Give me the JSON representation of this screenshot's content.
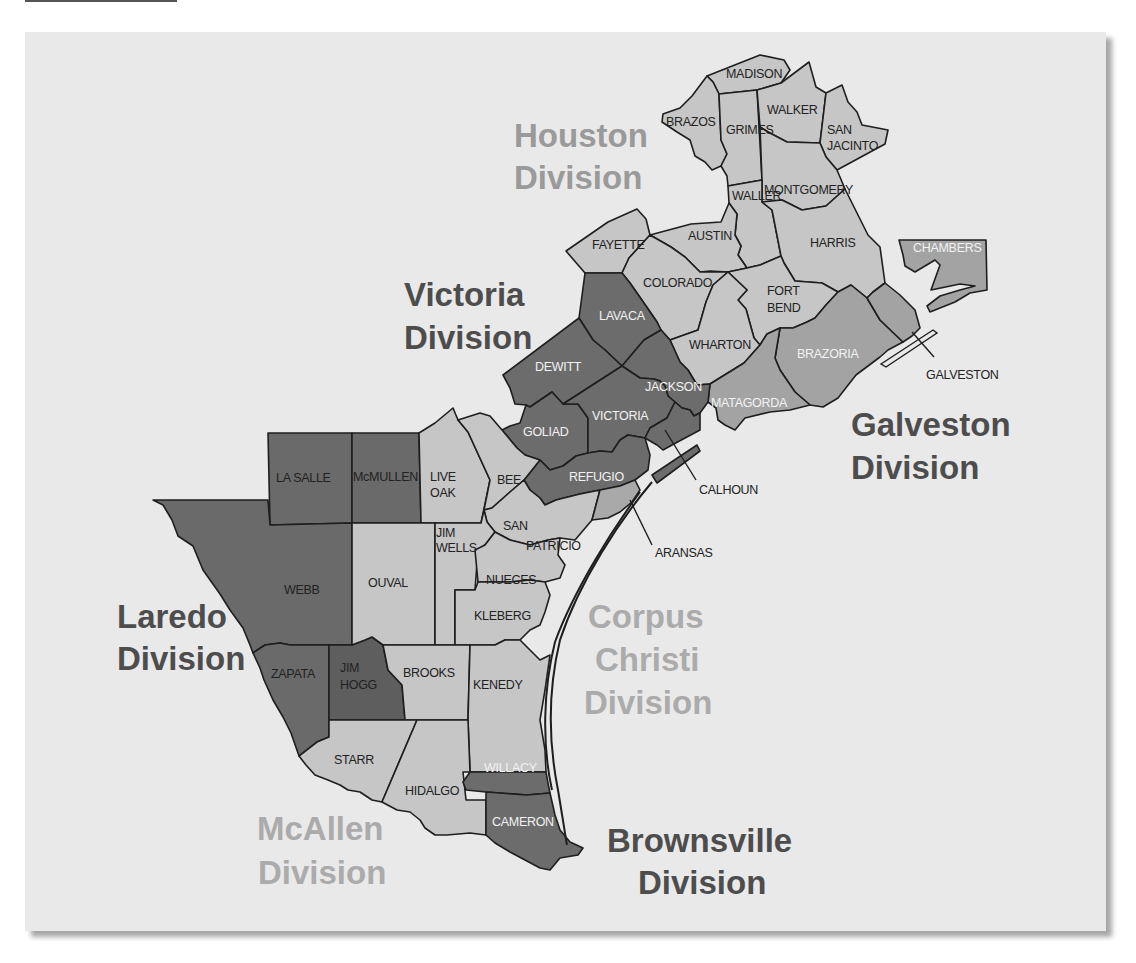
{
  "colors": {
    "card_background": "#e9e9e9",
    "fill_light": "#c6c6c6",
    "fill_medium": "#a3a3a3",
    "fill_dark": "#6c6c6c",
    "fill_darkest": "#585858",
    "label_dark": "#222222",
    "label_light": "#f2f2f2",
    "division_dark": "#4d4d4d",
    "division_faint": "#ababab",
    "division_medium": "#9a9a9a"
  },
  "divisions": [
    {
      "id": "houston",
      "line1": "Houston",
      "line2": "Division",
      "line3": ""
    },
    {
      "id": "victoria",
      "line1": "Victoria",
      "line2": "Division",
      "line3": ""
    },
    {
      "id": "galveston",
      "line1": "Galveston",
      "line2": "Division",
      "line3": ""
    },
    {
      "id": "laredo",
      "line1": "Laredo",
      "line2": "Division",
      "line3": ""
    },
    {
      "id": "corpus_christi",
      "line1": "Corpus",
      "line2": "Christi",
      "line3": "Division"
    },
    {
      "id": "mcallen",
      "line1": "McAllen",
      "line2": "Division",
      "line3": ""
    },
    {
      "id": "brownsville",
      "line1": "Brownsville",
      "line2": "Division",
      "line3": ""
    }
  ],
  "counties": {
    "madison": {
      "line1": "MADISON",
      "line2": "",
      "division": "Houston"
    },
    "brazos": {
      "line1": "BRAZOS",
      "line2": "",
      "division": "Houston"
    },
    "grimes": {
      "line1": "GRIMES",
      "line2": "",
      "division": "Houston"
    },
    "walker": {
      "line1": "WALKER",
      "line2": "",
      "division": "Houston"
    },
    "san_jacinto": {
      "line1": "SAN",
      "line2": "JACINTO",
      "division": "Houston"
    },
    "waller": {
      "line1": "WALLER",
      "line2": "",
      "division": "Houston"
    },
    "montgomery": {
      "line1": "MONTGOMERY",
      "line2": "",
      "division": "Houston"
    },
    "fayette": {
      "line1": "FAYETTE",
      "line2": "",
      "division": "Houston"
    },
    "austin": {
      "line1": "AUSTIN",
      "line2": "",
      "division": "Houston"
    },
    "harris": {
      "line1": "HARRIS",
      "line2": "",
      "division": "Houston"
    },
    "colorado": {
      "line1": "COLORADO",
      "line2": "",
      "division": "Houston"
    },
    "fort_bend": {
      "line1": "FORT",
      "line2": "BEND",
      "division": "Houston"
    },
    "wharton": {
      "line1": "WHARTON",
      "line2": "",
      "division": "Houston"
    },
    "chambers": {
      "line1": "CHAMBERS",
      "line2": "",
      "division": "Galveston"
    },
    "brazoria": {
      "line1": "BRAZORIA",
      "line2": "",
      "division": "Galveston"
    },
    "matagorda": {
      "line1": "MATAGORDA",
      "line2": "",
      "division": "Galveston"
    },
    "galveston": {
      "line1": "GALVESTON",
      "line2": "",
      "division": "Galveston"
    },
    "lavaca": {
      "line1": "LAVACA",
      "line2": "",
      "division": "Victoria"
    },
    "dewitt": {
      "line1": "DEWITT",
      "line2": "",
      "division": "Victoria"
    },
    "jackson": {
      "line1": "JACKSON",
      "line2": "",
      "division": "Victoria"
    },
    "goliad": {
      "line1": "GOLIAD",
      "line2": "",
      "division": "Victoria"
    },
    "victoria": {
      "line1": "VICTORIA",
      "line2": "",
      "division": "Victoria"
    },
    "refugio": {
      "line1": "REFUGIO",
      "line2": "",
      "division": "Victoria"
    },
    "calhoun": {
      "line1": "CALHOUN",
      "line2": "",
      "division": "Victoria"
    },
    "la_salle": {
      "line1": "LA SALLE",
      "line2": "",
      "division": "Laredo"
    },
    "mcmullen": {
      "line1": "McMULLEN",
      "line2": "",
      "division": "Laredo"
    },
    "webb": {
      "line1": "WEBB",
      "line2": "",
      "division": "Laredo"
    },
    "zapata": {
      "line1": "ZAPATA",
      "line2": "",
      "division": "Laredo"
    },
    "jim_hogg": {
      "line1": "JIM",
      "line2": "HOGG",
      "division": "Laredo"
    },
    "live_oak": {
      "line1": "LIVE",
      "line2": "OAK",
      "division": "Corpus Christi"
    },
    "bee": {
      "line1": "BEE",
      "line2": "",
      "division": "Corpus Christi"
    },
    "san_patricio": {
      "line1": "SAN",
      "line2": "PATRICIO",
      "division": "Corpus Christi"
    },
    "aransas": {
      "line1": "ARANSAS",
      "line2": "",
      "division": "Corpus Christi"
    },
    "jim_wells": {
      "line1": "JIM",
      "line2": "WELLS",
      "division": "Corpus Christi"
    },
    "duval": {
      "line1": "OUVAL",
      "line2": "",
      "division": "Corpus Christi"
    },
    "nueces": {
      "line1": "NUECES",
      "line2": "",
      "division": "Corpus Christi"
    },
    "kleberg": {
      "line1": "KLEBERG",
      "line2": "",
      "division": "Corpus Christi"
    },
    "brooks": {
      "line1": "BROOKS",
      "line2": "",
      "division": "Corpus Christi"
    },
    "kenedy": {
      "line1": "KENEDY",
      "line2": "",
      "division": "Corpus Christi"
    },
    "starr": {
      "line1": "STARR",
      "line2": "",
      "division": "McAllen"
    },
    "hidalgo": {
      "line1": "HIDALGO",
      "line2": "",
      "division": "McAllen"
    },
    "willacy": {
      "line1": "WILLACY",
      "line2": "",
      "division": "Brownsville"
    },
    "cameron": {
      "line1": "CAMERON",
      "line2": "",
      "division": "Brownsville"
    }
  }
}
